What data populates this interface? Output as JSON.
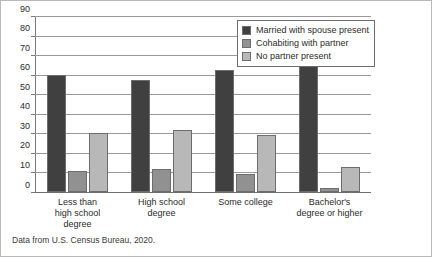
{
  "caption": "Data from U.S. Census Bureau, 2020.",
  "legend": {
    "position": "top-right",
    "entries": [
      {
        "label": "Married with spouse present",
        "color": "#404040"
      },
      {
        "label": "Cohabiting with partner",
        "color": "#919191"
      },
      {
        "label": "No partner present",
        "color": "#b8b8b8"
      }
    ]
  },
  "chart_data": {
    "type": "bar",
    "title": "",
    "xlabel": "",
    "ylabel": "",
    "ylim": [
      0,
      90
    ],
    "yticks": [
      0,
      10,
      20,
      30,
      40,
      50,
      60,
      70,
      80,
      90
    ],
    "ytick_labels": [
      "0",
      "10",
      "20",
      "30",
      "40",
      "50",
      "60",
      "70",
      "80",
      "90"
    ],
    "grid": true,
    "categories": [
      "Less than high school degree",
      "High school degree",
      "Some college",
      "Bachelor's degree or higher"
    ],
    "category_lines": [
      [
        "Less than",
        "high school",
        "degree"
      ],
      [
        "High school",
        "degree"
      ],
      [
        "Some college"
      ],
      [
        "Bachelor's",
        "degree or higher"
      ]
    ],
    "series": [
      {
        "name": "Married with spouse present",
        "color": "#404040",
        "values": [
          60,
          57.5,
          62.5,
          84
        ]
      },
      {
        "name": "Cohabiting with partner",
        "color": "#919191",
        "values": [
          11,
          12,
          9,
          2
        ]
      },
      {
        "name": "No partner present",
        "color": "#b8b8b8",
        "values": [
          30,
          31.5,
          29,
          13
        ]
      }
    ]
  }
}
